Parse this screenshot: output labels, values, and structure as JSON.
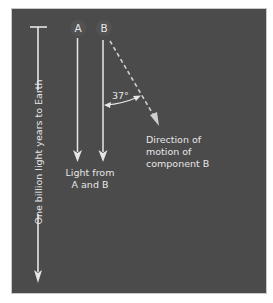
{
  "diagram": {
    "colors": {
      "background": "#4b4b4b",
      "foreground": "#e6e6e6",
      "page": "#ffffff"
    },
    "sources": [
      {
        "label": "A"
      },
      {
        "label": "B"
      }
    ],
    "scale_bar": {
      "label": "One billion light years to Earth"
    },
    "light_label": {
      "line1": "Light from",
      "line2": "A and B"
    },
    "angle": {
      "label": "37°"
    },
    "motion_label": {
      "line1": "Direction of",
      "line2": "motion of",
      "line3": "component B"
    }
  }
}
